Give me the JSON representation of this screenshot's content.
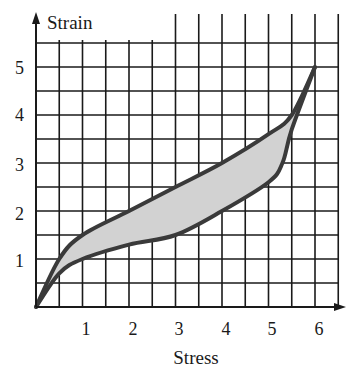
{
  "chart_data": {
    "type": "line",
    "title": "",
    "xlabel": "Stress",
    "ylabel": "Strain",
    "xlim": [
      0,
      6.5
    ],
    "ylim": [
      0,
      5.5
    ],
    "x_ticks": [
      "1",
      "2",
      "3",
      "4",
      "5",
      "6"
    ],
    "y_ticks": [
      "1",
      "2",
      "3",
      "4",
      "5"
    ],
    "grid": true,
    "grid_step": 0.5,
    "fill_between_series": true,
    "series": [
      {
        "name": "upper (loading)",
        "x": [
          0,
          0.5,
          1,
          2,
          3,
          4,
          5,
          5.5,
          6
        ],
        "y": [
          0,
          1,
          1.5,
          2,
          2.5,
          3,
          3.6,
          4,
          5
        ]
      },
      {
        "name": "lower (unloading)",
        "x": [
          0,
          0.5,
          1,
          2,
          3,
          4,
          5,
          5.3,
          5.5,
          6
        ],
        "y": [
          0,
          0.7,
          1,
          1.3,
          1.5,
          2,
          2.6,
          3,
          3.7,
          5
        ]
      }
    ],
    "colors": {
      "line": "#3a3a3a",
      "fill": "#d4d4d4",
      "grid": "#1a1a1a"
    }
  },
  "labels": {
    "xlabel": "Stress",
    "ylabel": "Strain",
    "x1": "1",
    "x2": "2",
    "x3": "3",
    "x4": "4",
    "x5": "5",
    "x6": "6",
    "y1": "1",
    "y2": "2",
    "y3": "3",
    "y4": "4",
    "y5": "5"
  }
}
